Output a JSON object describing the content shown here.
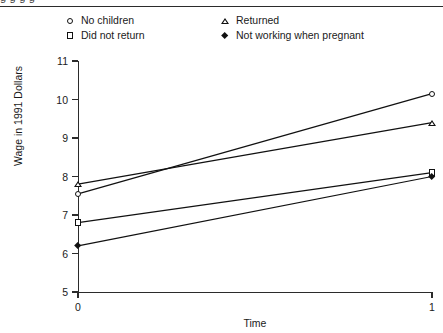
{
  "figure": {
    "top_cropped_text": "g                      g                      g                 g",
    "y_axis_title": "Wage in 1991 Dollars",
    "x_axis_title": "Time"
  },
  "legend": {
    "entries": [
      {
        "label": "No children",
        "marker": "circle-icon",
        "column": "left",
        "row": 0
      },
      {
        "label": "Did not return",
        "marker": "square-icon",
        "column": "left",
        "row": 1
      },
      {
        "label": "Returned",
        "marker": "triangle-icon",
        "column": "right",
        "row": 0
      },
      {
        "label": "Not working when pregnant",
        "marker": "diamond-icon",
        "column": "right",
        "row": 1
      }
    ]
  },
  "chart_data": {
    "type": "line",
    "title": "",
    "xlabel": "Time",
    "ylabel": "Wage in 1991 Dollars",
    "x": [
      0,
      1
    ],
    "xticklabels": [
      "0",
      "1"
    ],
    "xlim": [
      0,
      1
    ],
    "ylim": [
      5,
      11
    ],
    "yticks": [
      5,
      6,
      7,
      8,
      9,
      10,
      11
    ],
    "yticklabels": [
      "5",
      "6",
      "7",
      "8",
      "9",
      "10",
      "11"
    ],
    "grid": false,
    "legend_position": "top",
    "series": [
      {
        "name": "No children",
        "marker": "circle",
        "values": [
          7.55,
          10.15
        ]
      },
      {
        "name": "Returned",
        "marker": "triangle",
        "values": [
          7.8,
          9.4
        ]
      },
      {
        "name": "Did not return",
        "marker": "square",
        "values": [
          6.8,
          8.1
        ]
      },
      {
        "name": "Not working when pregnant",
        "marker": "diamond",
        "values": [
          6.2,
          8.0
        ]
      }
    ]
  }
}
